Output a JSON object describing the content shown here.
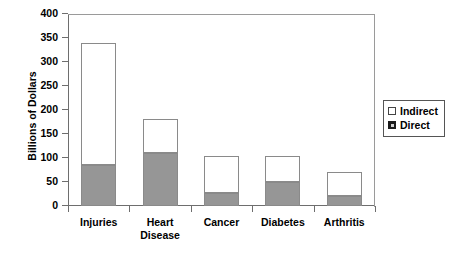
{
  "chart_data": {
    "type": "bar",
    "subtype": "stacked-vertical",
    "title": "",
    "xlabel": "",
    "ylabel": "Billions of Dollars",
    "categories": [
      "Injuries",
      "Heart Disease",
      "Cancer",
      "Diabetes",
      "Arthritis"
    ],
    "series": [
      {
        "name": "Direct",
        "values": [
          86,
          110,
          28,
          50,
          20
        ],
        "color": "#969696"
      },
      {
        "name": "Indirect",
        "values": [
          254,
          72,
          76,
          55,
          50
        ],
        "color": "#ffffff"
      }
    ],
    "totals": [
      340,
      182,
      104,
      105,
      70
    ],
    "ylim": [
      0,
      400
    ],
    "yticks": [
      0,
      50,
      100,
      150,
      200,
      250,
      300,
      350,
      400
    ],
    "ytick_labels": [
      "0",
      "50",
      "100",
      "150",
      "200",
      "250",
      "300",
      "350",
      "400"
    ],
    "grid": false,
    "legend_position": "right",
    "legend_entries": [
      "Indirect",
      "Direct"
    ]
  },
  "legend": {
    "indirect_label": "Indirect",
    "direct_label": "Direct"
  }
}
